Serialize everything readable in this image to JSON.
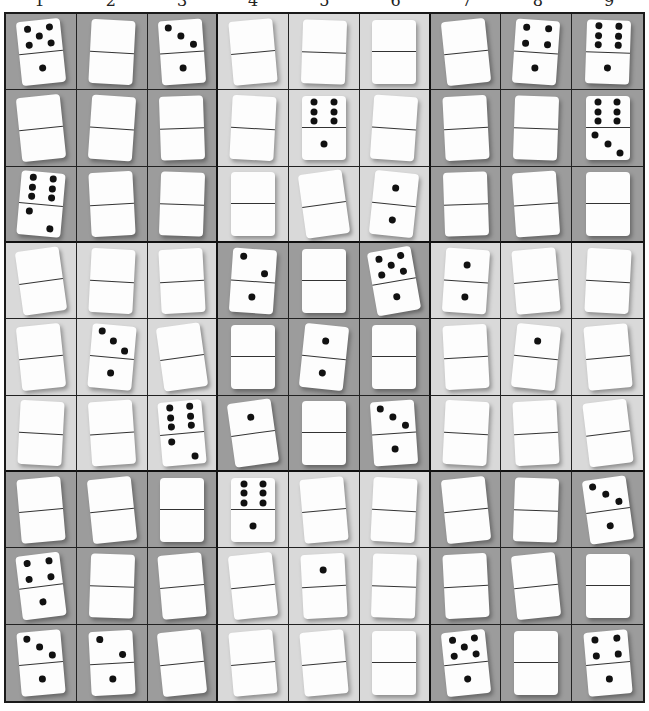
{
  "puzzle": {
    "column_labels": [
      "1",
      "2",
      "3",
      "4",
      "5",
      "6",
      "7",
      "8",
      "9"
    ],
    "colors": {
      "dark_box": "#9c9c9c",
      "light_box": "#d9d9d9",
      "domino": "#fdfdfd",
      "pip": "#111111",
      "grid_line": "#1a1a1a"
    },
    "box_shading": [
      [
        "dark",
        "light",
        "dark"
      ],
      [
        "light",
        "dark",
        "light"
      ],
      [
        "dark",
        "light",
        "dark"
      ]
    ],
    "rows": [
      [
        [
          5,
          1
        ],
        null,
        [
          3,
          1
        ],
        null,
        null,
        null,
        null,
        [
          4,
          1
        ],
        [
          6,
          1
        ]
      ],
      [
        null,
        null,
        null,
        null,
        [
          6,
          1
        ],
        null,
        null,
        null,
        [
          6,
          3
        ]
      ],
      [
        [
          6,
          2
        ],
        null,
        null,
        null,
        null,
        [
          1,
          1
        ],
        null,
        null,
        null
      ],
      [
        null,
        null,
        null,
        [
          2,
          1
        ],
        null,
        [
          5,
          1
        ],
        [
          1,
          1
        ],
        null,
        null
      ],
      [
        null,
        [
          3,
          1
        ],
        null,
        null,
        [
          1,
          1
        ],
        null,
        null,
        [
          1,
          0
        ],
        null
      ],
      [
        null,
        null,
        [
          6,
          2
        ],
        [
          1,
          0
        ],
        null,
        [
          3,
          1
        ],
        null,
        null,
        null
      ],
      [
        null,
        null,
        null,
        [
          6,
          1
        ],
        null,
        null,
        null,
        null,
        [
          3,
          1
        ]
      ],
      [
        [
          4,
          1
        ],
        null,
        null,
        null,
        [
          1,
          0
        ],
        null,
        null,
        null,
        null
      ],
      [
        [
          3,
          1
        ],
        [
          2,
          1
        ],
        null,
        null,
        null,
        null,
        [
          5,
          1
        ],
        null,
        [
          4,
          1
        ]
      ]
    ],
    "tilts": [
      [
        -6,
        3,
        -4,
        -5,
        2,
        0,
        -6,
        4,
        2
      ],
      [
        -6,
        4,
        -2,
        3,
        0,
        4,
        -3,
        2,
        0
      ],
      [
        5,
        -3,
        2,
        0,
        -8,
        6,
        -2,
        -4,
        0
      ],
      [
        -8,
        3,
        -3,
        4,
        0,
        -10,
        4,
        -5,
        3
      ],
      [
        -6,
        5,
        -8,
        0,
        6,
        0,
        -3,
        6,
        -5
      ],
      [
        3,
        -4,
        -5,
        -8,
        0,
        -4,
        3,
        -3,
        -7
      ],
      [
        -5,
        -6,
        0,
        0,
        -5,
        3,
        -6,
        2,
        -8
      ],
      [
        -7,
        2,
        -5,
        -6,
        -3,
        2,
        -3,
        -6,
        0
      ],
      [
        -5,
        -3,
        -6,
        -5,
        -5,
        0,
        -6,
        0,
        -5
      ]
    ]
  }
}
